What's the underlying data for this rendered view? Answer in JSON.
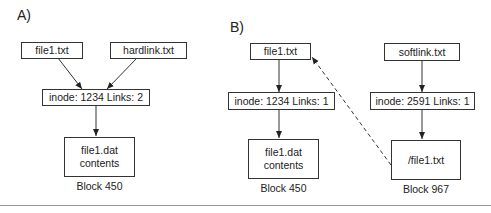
{
  "panels": [
    {
      "label": "A)",
      "nodes": {
        "file1": "file1.txt",
        "hardlink": "hardlink.txt",
        "inode": "inode: 1234  Links: 2",
        "data_line1": "file1.dat",
        "data_line2": "contents",
        "block": "Block 450"
      }
    },
    {
      "label": "B)",
      "nodes": {
        "file1": "file1.txt",
        "inode1": "inode: 1234  Links: 1",
        "data_line1": "file1.dat",
        "data_line2": "contents",
        "block1": "Block 450",
        "softlink": "softlink.txt",
        "inode2": "inode: 2591  Links: 1",
        "data2": "/file1.txt",
        "block2": "Block 967"
      }
    }
  ],
  "edges": [
    {
      "from": "A.file1",
      "to": "A.inode",
      "style": "solid"
    },
    {
      "from": "A.hardlink",
      "to": "A.inode",
      "style": "solid"
    },
    {
      "from": "A.inode",
      "to": "A.data",
      "style": "solid"
    },
    {
      "from": "B.file1",
      "to": "B.inode1",
      "style": "solid"
    },
    {
      "from": "B.inode1",
      "to": "B.data1",
      "style": "solid"
    },
    {
      "from": "B.softlink",
      "to": "B.inode2",
      "style": "solid"
    },
    {
      "from": "B.inode2",
      "to": "B.data2",
      "style": "solid"
    },
    {
      "from": "B.data2",
      "to": "B.file1",
      "style": "dashed"
    }
  ]
}
